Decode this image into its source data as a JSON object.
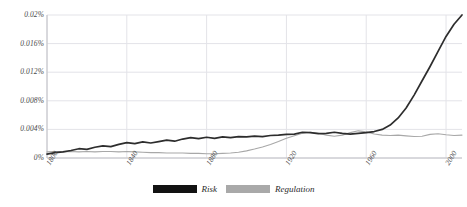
{
  "chart_data": {
    "type": "line",
    "title": "",
    "subtitle": "",
    "xlabel": "",
    "ylabel": "",
    "xlim": [
      1800,
      2008
    ],
    "ylim": [
      0,
      0.02
    ],
    "grid": true,
    "legend_position": "bottom-center",
    "y_unit": "percent",
    "x_ticks": [
      1800,
      1840,
      1880,
      1920,
      1960,
      2000
    ],
    "x_tick_labels": [
      "1800",
      "1840",
      "1880",
      "1920",
      "1960",
      "2000"
    ],
    "y_ticks": [
      0,
      0.004,
      0.008,
      0.012,
      0.016,
      0.02
    ],
    "y_tick_labels": [
      "0%",
      "0.004%",
      "0.008%",
      "0.012%",
      "0.016%",
      "0.02%"
    ],
    "colors": {
      "risk": "#2d2d2d",
      "regulation": "#a8a8a8",
      "gridline": "#e3e3e8",
      "axis": "#c8c8cc",
      "text": "#4a4a4a"
    },
    "series": [
      {
        "name": "Risk",
        "color": "#2d2d2d",
        "x": [
          1800,
          1804,
          1808,
          1812,
          1816,
          1820,
          1824,
          1828,
          1832,
          1836,
          1840,
          1844,
          1848,
          1852,
          1856,
          1860,
          1864,
          1868,
          1872,
          1876,
          1880,
          1884,
          1888,
          1892,
          1896,
          1900,
          1904,
          1908,
          1912,
          1916,
          1920,
          1924,
          1928,
          1932,
          1936,
          1940,
          1944,
          1948,
          1952,
          1956,
          1960,
          1964,
          1968,
          1972,
          1976,
          1980,
          1984,
          1988,
          1992,
          1996,
          2000,
          2004,
          2008
        ],
        "values": [
          0.00055,
          0.00075,
          0.00085,
          0.00105,
          0.0013,
          0.0012,
          0.0015,
          0.0017,
          0.0016,
          0.0019,
          0.00215,
          0.002,
          0.00225,
          0.0021,
          0.0023,
          0.0025,
          0.00235,
          0.00265,
          0.00285,
          0.0027,
          0.0029,
          0.00275,
          0.00295,
          0.00285,
          0.003,
          0.00295,
          0.00305,
          0.003,
          0.00315,
          0.0032,
          0.0033,
          0.00335,
          0.0036,
          0.00355,
          0.0034,
          0.00345,
          0.0036,
          0.00345,
          0.00335,
          0.00345,
          0.00355,
          0.0037,
          0.004,
          0.0046,
          0.0056,
          0.007,
          0.0088,
          0.0108,
          0.0128,
          0.0149,
          0.017,
          0.0187,
          0.02
        ]
      },
      {
        "name": "Regulation",
        "color": "#a8a8a8",
        "x": [
          1800,
          1804,
          1808,
          1812,
          1816,
          1820,
          1824,
          1828,
          1832,
          1836,
          1840,
          1844,
          1848,
          1852,
          1856,
          1860,
          1864,
          1868,
          1872,
          1876,
          1880,
          1884,
          1888,
          1892,
          1896,
          1900,
          1904,
          1908,
          1912,
          1916,
          1920,
          1924,
          1928,
          1932,
          1936,
          1940,
          1944,
          1948,
          1952,
          1956,
          1960,
          1964,
          1968,
          1972,
          1976,
          1980,
          1984,
          1988,
          1992,
          1996,
          2000,
          2004,
          2008
        ],
        "values": [
          0.00085,
          0.0009,
          0.00085,
          0.0009,
          0.00085,
          0.0009,
          0.00085,
          0.0009,
          0.0009,
          0.00085,
          0.0009,
          0.00085,
          0.0008,
          0.00075,
          0.00075,
          0.0007,
          0.0007,
          0.0007,
          0.00065,
          0.00065,
          0.0006,
          0.0006,
          0.00065,
          0.0007,
          0.0008,
          0.001,
          0.00125,
          0.00155,
          0.0019,
          0.0023,
          0.00275,
          0.0031,
          0.00345,
          0.0036,
          0.00345,
          0.0032,
          0.00305,
          0.0032,
          0.00355,
          0.0038,
          0.00365,
          0.00335,
          0.0032,
          0.00315,
          0.0032,
          0.0031,
          0.003,
          0.00305,
          0.0033,
          0.0034,
          0.00325,
          0.00315,
          0.0032
        ]
      }
    ]
  },
  "legend": {
    "items": [
      {
        "label": "Risk",
        "color": "#121212"
      },
      {
        "label": "Regulation",
        "color": "#a9a9a9"
      }
    ]
  }
}
